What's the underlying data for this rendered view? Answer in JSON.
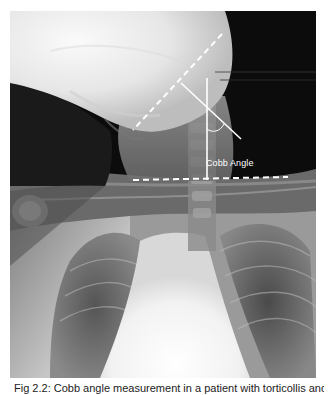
{
  "figure": {
    "type": "radiograph",
    "view": "frontal chest/neck X-ray",
    "annotations": {
      "angle_label": "Cobb Angle",
      "line_color": "#ffffff",
      "upper_endplate_line": "dashed diagonal",
      "lower_endplate_line": "dashed horizontal",
      "perpendicular_line": "solid diagonal",
      "reference_line": "solid vertical",
      "angle_arc": "arc between perpendicular and vertical lines"
    },
    "caption": "Fig 2.2: Cobb angle measurement in a patient with torticollis and cervical scoliosis"
  },
  "colors": {
    "background": "#ffffff",
    "annotation": "#ffffff",
    "caption_text": "#222222"
  }
}
